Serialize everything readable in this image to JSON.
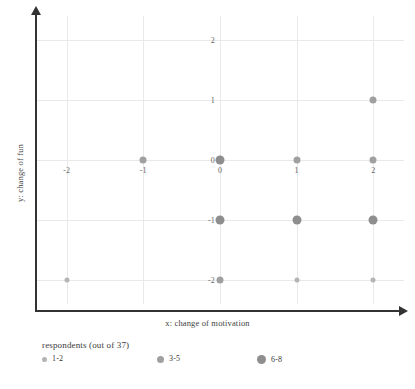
{
  "chart_data": {
    "type": "scatter",
    "title": "",
    "xlabel": "x: change of motivation",
    "ylabel": "y: change of fun",
    "xlim": [
      -2.4,
      2.4
    ],
    "ylim": [
      -2.4,
      2.4
    ],
    "xticks": [
      "-2",
      "-1",
      "0",
      "1",
      "2"
    ],
    "xtick_values": [
      -2,
      -1,
      0,
      1,
      2
    ],
    "yticks": [
      "2",
      "1",
      "0",
      "-1",
      "-2"
    ],
    "ytick_values": [
      2,
      1,
      0,
      -1,
      -2
    ],
    "grid": true,
    "legend_position": "below-axis-left",
    "size_encoding": "respondents",
    "points": [
      {
        "x": 2,
        "y": 1,
        "size": 2,
        "bucket": "3-5"
      },
      {
        "x": -1,
        "y": 0,
        "size": 2,
        "bucket": "3-5"
      },
      {
        "x": 0,
        "y": 0,
        "size": 3,
        "bucket": "6-8"
      },
      {
        "x": 1,
        "y": 0,
        "size": 2,
        "bucket": "3-5"
      },
      {
        "x": 2,
        "y": 0,
        "size": 2,
        "bucket": "3-5"
      },
      {
        "x": 0,
        "y": -1,
        "size": 3,
        "bucket": "6-8"
      },
      {
        "x": 1,
        "y": -1,
        "size": 3,
        "bucket": "6-8"
      },
      {
        "x": 2,
        "y": -1,
        "size": 3,
        "bucket": "6-8"
      },
      {
        "x": -2,
        "y": -2,
        "size": 1,
        "bucket": "1-2"
      },
      {
        "x": 0,
        "y": -2,
        "size": 2,
        "bucket": "3-5"
      },
      {
        "x": 1,
        "y": -2,
        "size": 1,
        "bucket": "1-2"
      },
      {
        "x": 2,
        "y": -2,
        "size": 1,
        "bucket": "1-2"
      }
    ]
  },
  "legend": {
    "title": "respondents (out of 37)",
    "items": [
      {
        "label": "1-2",
        "size": 1
      },
      {
        "label": "3-5",
        "size": 2
      },
      {
        "label": "6-8",
        "size": 3
      }
    ]
  },
  "colors": {
    "marker_small": "#b4b4b4",
    "marker_medium": "#a0a0a0",
    "marker_large": "#8e8e8e",
    "grid": "#e9e9e9",
    "axis": "#333333",
    "text": "#3a3a3a",
    "background": "#ffffff"
  }
}
